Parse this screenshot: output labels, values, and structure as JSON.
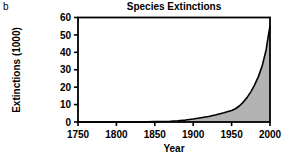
{
  "figure": {
    "panel_label": "b",
    "background_color": "#ffffff"
  },
  "chart_data": {
    "type": "area",
    "title": "Species Extinctions",
    "xlabel": "Year",
    "ylabel": "Extinctions (1000)",
    "xlim": [
      1750,
      2000
    ],
    "ylim": [
      0,
      60
    ],
    "xticks": [
      1750,
      1800,
      1850,
      1900,
      1950,
      2000
    ],
    "xtick_labels": [
      "1750",
      "1800",
      "1850",
      "1900",
      "1950",
      "2000"
    ],
    "yticks": [
      0,
      10,
      20,
      30,
      40,
      50,
      60
    ],
    "ytick_labels": [
      "0",
      "10",
      "20",
      "30",
      "40",
      "50",
      "60"
    ],
    "grid": false,
    "legend": null,
    "series": [
      {
        "name": "Cumulative species extinctions",
        "fill_color": "#b3b3b3",
        "line_color": "#000000",
        "x": [
          1750,
          1800,
          1830,
          1850,
          1870,
          1880,
          1890,
          1900,
          1910,
          1920,
          1930,
          1940,
          1950,
          1955,
          1960,
          1965,
          1970,
          1975,
          1980,
          1985,
          1990,
          1995,
          1998,
          2000
        ],
        "values": [
          0,
          0,
          0,
          0.2,
          0.4,
          0.7,
          1.1,
          1.7,
          2.4,
          3.2,
          4.2,
          5.3,
          6.6,
          7.6,
          9.2,
          11.3,
          14.0,
          17.3,
          21.3,
          26.2,
          32.5,
          41.5,
          50.0,
          55.0
        ]
      }
    ]
  },
  "axes": {
    "frame_color": "#000000",
    "tick_color": "#000000"
  }
}
